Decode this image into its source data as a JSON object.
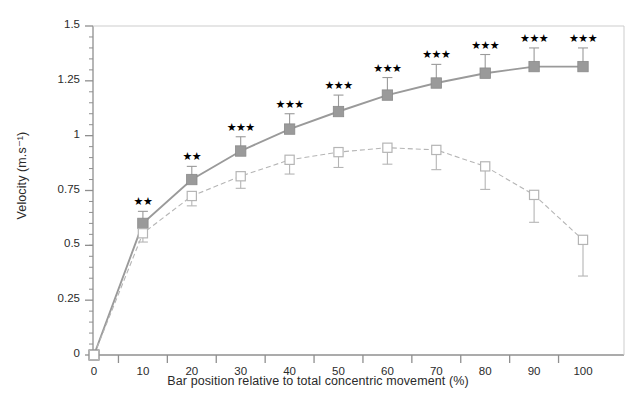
{
  "chart_data": {
    "type": "line",
    "title": "",
    "xlabel": "Bar position relative to total concentric movement (%)",
    "ylabel": "Velocity (m.s-1)",
    "ylabel_display": "Velocity (m.s⁻¹)",
    "x": [
      0,
      10,
      20,
      30,
      40,
      50,
      60,
      70,
      80,
      90,
      100
    ],
    "xlim": [
      -4,
      104
    ],
    "ylim": [
      0,
      1.5
    ],
    "xticks": [
      0,
      10,
      20,
      30,
      40,
      50,
      60,
      70,
      80,
      90,
      100
    ],
    "xtick_labels": [
      "0",
      "10",
      "20",
      "30",
      "40",
      "50",
      "60",
      "70",
      "80",
      "90",
      "100"
    ],
    "yticks": [
      0,
      0.25,
      0.5,
      0.75,
      1,
      1.25,
      1.5
    ],
    "ytick_labels": [
      "0",
      "0.25",
      "0.5",
      "0.75",
      "1",
      "1.25",
      "1.5"
    ],
    "y_minor_tick_step": 0.05,
    "grid": false,
    "legend": "none",
    "series": [
      {
        "name": "filled-square-series",
        "marker": "filled-square",
        "color": "#9a9a9a",
        "line_style": "solid",
        "values": [
          0,
          0.6,
          0.8,
          0.93,
          1.03,
          1.11,
          1.185,
          1.24,
          1.285,
          1.315,
          1.315
        ],
        "errors": [
          0,
          0.055,
          0.06,
          0.065,
          0.07,
          0.075,
          0.08,
          0.085,
          0.085,
          0.085,
          0.085
        ]
      },
      {
        "name": "open-square-series",
        "marker": "open-square",
        "color": "#b5b5b5",
        "line_style": "dashed",
        "values": [
          0,
          0.555,
          0.725,
          0.815,
          0.89,
          0.925,
          0.945,
          0.935,
          0.86,
          0.73,
          0.525
        ],
        "errors": [
          0,
          0.04,
          0.045,
          0.055,
          0.065,
          0.07,
          0.075,
          0.09,
          0.105,
          0.125,
          0.165
        ]
      }
    ],
    "annotations": [
      {
        "x": 10,
        "text": "**"
      },
      {
        "x": 20,
        "text": "**"
      },
      {
        "x": 30,
        "text": "***"
      },
      {
        "x": 40,
        "text": "***"
      },
      {
        "x": 50,
        "text": "***"
      },
      {
        "x": 60,
        "text": "***"
      },
      {
        "x": 70,
        "text": "***"
      },
      {
        "x": 80,
        "text": "***"
      },
      {
        "x": 90,
        "text": "***"
      },
      {
        "x": 100,
        "text": "***"
      }
    ]
  },
  "figure": {
    "background": "#ffffff",
    "axis_color": "#8f8f8f",
    "text_color": "#2a2a2a",
    "caption_fragment": ""
  }
}
